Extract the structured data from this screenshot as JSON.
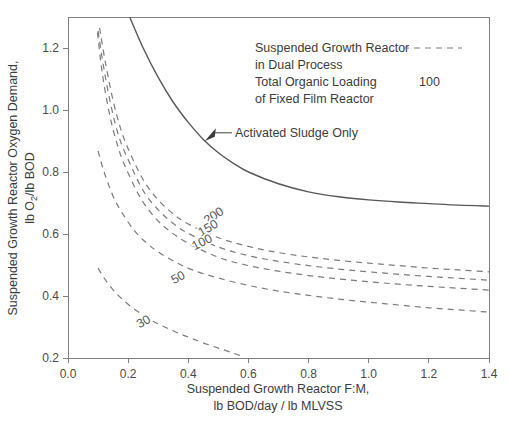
{
  "chart_data": {
    "type": "line",
    "title": "",
    "xlabel": "Suspended Growth Reactor F:M,",
    "xlabel_line2": "lb BOD/day / lb MLVSS",
    "ylabel": "Suspended Growth Reactor Oxygen Demand,",
    "ylabel_line2": "lb O₂/lb BOD",
    "xlim": [
      0.0,
      1.4
    ],
    "ylim": [
      0.2,
      1.3
    ],
    "xticks": [
      0.0,
      0.2,
      0.4,
      0.6,
      0.8,
      1.0,
      1.2,
      1.4
    ],
    "xtick_labels": [
      "0.0",
      "0.2",
      "0.4",
      "0.6",
      "0.8",
      "1.0",
      "1.2",
      "1.4"
    ],
    "yticks": [
      0.2,
      0.4,
      0.6,
      0.8,
      1.0,
      1.2
    ],
    "ytick_labels": [
      "0.2",
      "0.4",
      "0.6",
      "0.8",
      "1.0",
      "1.2"
    ],
    "grid": false,
    "legend_position": "upper-right-inside",
    "series": [
      {
        "name": "Activated Sludge Only",
        "style": "solid",
        "label": "Activated Sludge Only",
        "x": [
          0.205,
          0.25,
          0.3,
          0.35,
          0.4,
          0.45,
          0.5,
          0.55,
          0.6,
          0.7,
          0.8,
          0.9,
          1.0,
          1.1,
          1.2,
          1.3,
          1.4
        ],
        "y": [
          1.3,
          1.2,
          1.105,
          1.025,
          0.96,
          0.905,
          0.862,
          0.828,
          0.8,
          0.762,
          0.736,
          0.72,
          0.71,
          0.703,
          0.698,
          0.693,
          0.69
        ]
      },
      {
        "name": "200",
        "style": "dashed",
        "label": "200",
        "x": [
          0.105,
          0.125,
          0.15,
          0.175,
          0.2,
          0.25,
          0.3,
          0.35,
          0.4,
          0.5,
          0.6,
          0.7,
          0.8,
          0.9,
          1.0,
          1.1,
          1.2,
          1.3,
          1.4
        ],
        "y": [
          1.265,
          1.15,
          1.03,
          0.94,
          0.875,
          0.775,
          0.71,
          0.665,
          0.632,
          0.588,
          0.56,
          0.54,
          0.526,
          0.515,
          0.506,
          0.498,
          0.49,
          0.484,
          0.478
        ]
      },
      {
        "name": "150",
        "style": "dashed",
        "label": "150",
        "x": [
          0.1,
          0.12,
          0.145,
          0.17,
          0.2,
          0.25,
          0.3,
          0.35,
          0.4,
          0.5,
          0.6,
          0.7,
          0.8,
          0.9,
          1.0,
          1.1,
          1.2,
          1.3,
          1.4
        ],
        "y": [
          1.255,
          1.13,
          1.005,
          0.912,
          0.84,
          0.74,
          0.678,
          0.634,
          0.602,
          0.558,
          0.53,
          0.512,
          0.498,
          0.487,
          0.478,
          0.47,
          0.463,
          0.457,
          0.451
        ]
      },
      {
        "name": "100",
        "style": "dashed",
        "label": "100",
        "x": [
          0.098,
          0.115,
          0.14,
          0.165,
          0.19,
          0.24,
          0.29,
          0.34,
          0.4,
          0.5,
          0.6,
          0.7,
          0.8,
          0.9,
          1.0,
          1.1,
          1.2,
          1.3,
          1.4
        ],
        "y": [
          1.25,
          1.112,
          0.978,
          0.885,
          0.818,
          0.718,
          0.652,
          0.608,
          0.57,
          0.525,
          0.498,
          0.48,
          0.466,
          0.455,
          0.446,
          0.438,
          0.431,
          0.425,
          0.419
        ]
      },
      {
        "name": "50",
        "style": "dashed",
        "label": "50",
        "x": [
          0.1,
          0.12,
          0.15,
          0.18,
          0.22,
          0.26,
          0.3,
          0.36,
          0.42,
          0.5,
          0.6,
          0.7,
          0.8,
          0.9,
          1.0,
          1.1,
          1.2,
          1.3,
          1.4
        ],
        "y": [
          0.868,
          0.8,
          0.722,
          0.668,
          0.612,
          0.572,
          0.542,
          0.508,
          0.482,
          0.458,
          0.434,
          0.416,
          0.402,
          0.39,
          0.38,
          0.371,
          0.362,
          0.355,
          0.348
        ]
      },
      {
        "name": "30",
        "style": "dashed",
        "label": "30",
        "x": [
          0.1,
          0.12,
          0.15,
          0.18,
          0.22,
          0.26,
          0.3,
          0.34,
          0.38,
          0.42,
          0.46,
          0.5,
          0.54,
          0.58
        ],
        "y": [
          0.49,
          0.458,
          0.42,
          0.39,
          0.358,
          0.332,
          0.31,
          0.292,
          0.275,
          0.26,
          0.245,
          0.232,
          0.219,
          0.205
        ]
      }
    ],
    "curve_labels": [
      {
        "text": "200",
        "x": 0.492,
        "y": 0.648,
        "rotate": -33
      },
      {
        "text": "150",
        "x": 0.472,
        "y": 0.608,
        "rotate": -30
      },
      {
        "text": "100",
        "x": 0.452,
        "y": 0.562,
        "rotate": -27
      },
      {
        "text": "50",
        "x": 0.372,
        "y": 0.448,
        "rotate": -27
      },
      {
        "text": "30",
        "x": 0.258,
        "y": 0.306,
        "rotate": -30
      }
    ],
    "annotations": [
      {
        "text": "Activated Sludge Only",
        "target_x": 0.455,
        "target_y": 0.9,
        "text_x": 0.555,
        "text_y": 0.928
      }
    ],
    "legend": {
      "lines": [
        "Suspended Growth Reactor",
        "in Dual Process",
        "Total Organic Loading",
        "of Fixed Film Reactor"
      ],
      "dash_sample_row": 0,
      "value_label": "100",
      "value_row": 2
    }
  }
}
